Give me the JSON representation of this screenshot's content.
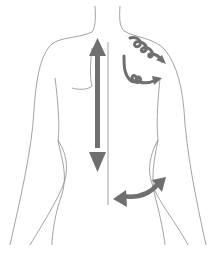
{
  "figure": {
    "colors": {
      "background": "#ffffff",
      "outline": "#8a8a8a",
      "arrow": "#6f6f6f"
    },
    "arrows": [
      {
        "name": "vertical-double-arrow",
        "direction": "up-down",
        "position": "left of spine"
      },
      {
        "name": "circular-arrow-upper",
        "direction": "spiral right-down",
        "position": "right shoulder"
      },
      {
        "name": "circular-arrow-lower",
        "direction": "spiral right",
        "position": "right shoulder blade"
      },
      {
        "name": "curved-double-arrow",
        "direction": "left-right",
        "position": "right lower back"
      }
    ]
  }
}
